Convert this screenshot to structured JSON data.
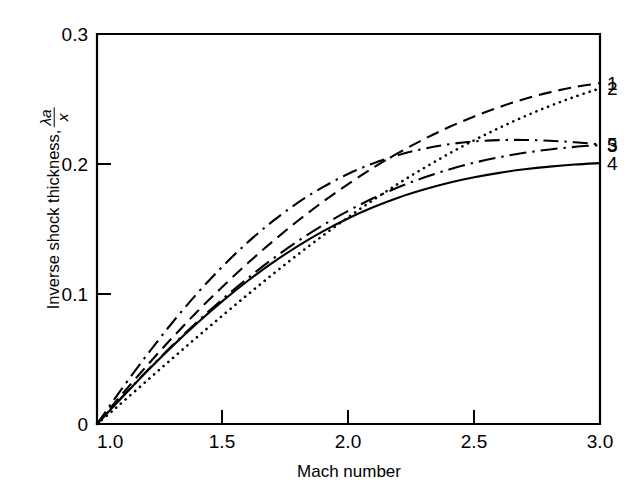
{
  "chart_data": {
    "type": "line",
    "title": "",
    "xlabel": "Mach number",
    "ylabel": "Inverse shock thickness, λa/x",
    "ylabel_text": "Inverse shock thickness,",
    "ylabel_frac_numerator": "λa",
    "ylabel_frac_denominator": "x",
    "xlim": [
      1.0,
      3.0
    ],
    "ylim": [
      0.0,
      0.3
    ],
    "xticks": [
      1.0,
      1.5,
      2.0,
      2.5,
      3.0
    ],
    "xticklabels": [
      "1.0",
      "1.5",
      "2.0",
      "2.5",
      "3.0"
    ],
    "yticks": [
      0.0,
      0.1,
      0.2,
      0.3
    ],
    "yticklabels": [
      "0",
      "0.1",
      "0.2",
      "0.3"
    ],
    "grid": false,
    "legend_position": "right-edge-curve-labels",
    "x": [
      1.0,
      1.05,
      1.1,
      1.2,
      1.3,
      1.4,
      1.5,
      1.6,
      1.7,
      1.8,
      1.9,
      2.0,
      2.1,
      2.2,
      2.3,
      2.4,
      2.5,
      2.6,
      2.7,
      2.8,
      2.9,
      3.0
    ],
    "series": [
      {
        "name": "1",
        "label": "1",
        "linestyle": "dashed",
        "dasharray": "13 7",
        "color": "#000000",
        "values": [
          0.0,
          0.0115,
          0.023,
          0.0452,
          0.0665,
          0.0868,
          0.1058,
          0.1238,
          0.1407,
          0.1565,
          0.1712,
          0.1848,
          0.1973,
          0.2087,
          0.2191,
          0.2284,
          0.2366,
          0.2438,
          0.25,
          0.2551,
          0.2592,
          0.2622
        ],
        "endpoint_value": 0.2622,
        "peak_value": 0.2622,
        "peak_x": 3.0
      },
      {
        "name": "2",
        "label": "2",
        "linestyle": "dotted",
        "dasharray": "0.1 6.2",
        "color": "#000000",
        "values": [
          0.0,
          0.0082,
          0.0166,
          0.0336,
          0.0505,
          0.0672,
          0.0836,
          0.0997,
          0.1154,
          0.1306,
          0.1452,
          0.1592,
          0.1725,
          0.1851,
          0.1969,
          0.208,
          0.2183,
          0.2278,
          0.2366,
          0.2446,
          0.2518,
          0.2582
        ],
        "endpoint_value": 0.2582,
        "peak_value": 0.2582,
        "peak_x": 3.0
      },
      {
        "name": "5",
        "label": "5",
        "linestyle": "dashdot",
        "dasharray": "15 6 2.4 6",
        "color": "#000000",
        "values": [
          0.0,
          0.0138,
          0.0274,
          0.0535,
          0.0781,
          0.1008,
          0.1214,
          0.1399,
          0.1562,
          0.1704,
          0.1824,
          0.1925,
          0.2006,
          0.207,
          0.2118,
          0.2152,
          0.2174,
          0.2184,
          0.2185,
          0.2179,
          0.2167,
          0.2151
        ],
        "endpoint_value": 0.2151,
        "peak_value": 0.2185,
        "peak_x": 2.7
      },
      {
        "name": "3",
        "label": "3",
        "linestyle": "longdash-dot",
        "dasharray": "17 6 2.4 6",
        "color": "#000000",
        "values": [
          0.0,
          0.0104,
          0.0208,
          0.0411,
          0.0605,
          0.0789,
          0.0962,
          0.1123,
          0.1272,
          0.1408,
          0.1531,
          0.1641,
          0.1738,
          0.1823,
          0.1896,
          0.1958,
          0.201,
          0.2052,
          0.2086,
          0.2112,
          0.2132,
          0.2146
        ],
        "endpoint_value": 0.2146,
        "peak_value": 0.2146,
        "peak_x": 3.0
      },
      {
        "name": "4",
        "label": "4",
        "linestyle": "solid",
        "dasharray": "",
        "color": "#000000",
        "values": [
          0.0,
          0.0103,
          0.0206,
          0.0407,
          0.0599,
          0.0779,
          0.0947,
          0.1102,
          0.1243,
          0.1371,
          0.1484,
          0.1583,
          0.1669,
          0.1743,
          0.1804,
          0.1856,
          0.1898,
          0.1932,
          0.1959,
          0.198,
          0.1996,
          0.2007
        ],
        "endpoint_value": 0.2007,
        "peak_value": 0.2007,
        "peak_x": 3.0
      }
    ],
    "curve_labels": [
      {
        "text": "1",
        "series": "1"
      },
      {
        "text": "2",
        "series": "2"
      },
      {
        "text": "5",
        "series": "5"
      },
      {
        "text": "3",
        "series": "3"
      },
      {
        "text": "4",
        "series": "4"
      }
    ]
  }
}
